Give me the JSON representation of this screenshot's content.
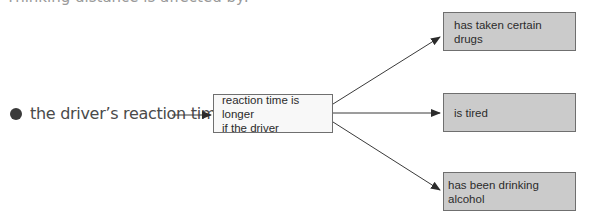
{
  "heading": {
    "text": "Thinking distance is affected by:"
  },
  "diagram": {
    "source": {
      "text": "the driver’s reaction time"
    },
    "middle_box": {
      "line1": "reaction time is longer",
      "line2": "if the driver"
    },
    "outcomes": [
      {
        "label": "has taken certain drugs"
      },
      {
        "label": "is tired"
      },
      {
        "label": "has been drinking alcohol"
      }
    ],
    "colors": {
      "outcome_fill": "#cbcbcb",
      "middle_fill": "#f8f8f8",
      "stroke": "#3a3a3a"
    }
  }
}
